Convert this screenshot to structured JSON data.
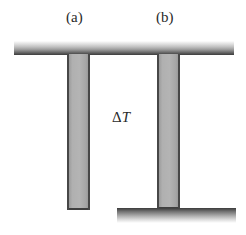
{
  "figure": {
    "type": "thermal-expansion-column-diagram",
    "background_color": "#ffffff",
    "width_px": 246,
    "height_px": 235
  },
  "labels": {
    "panel_a": "(a)",
    "panel_b": "(b)"
  },
  "annotation": {
    "delta_symbol": "Δ",
    "temperature_symbol": "T",
    "full_text": "ΔT"
  },
  "elements": {
    "top_bar": {
      "name": "top-support-bar",
      "gradient_from": "#ffffff",
      "gradient_to": "#3d3d3d"
    },
    "bottom_bar": {
      "name": "bottom-support-bar",
      "gradient_from": "#3c3c3c",
      "gradient_to": "#ffffff"
    },
    "column_a": {
      "name": "column-a",
      "fill": "#b2b2b2",
      "edge": "#474747"
    },
    "column_b": {
      "name": "column-b",
      "fill": "#b2b2b2",
      "edge": "#474747"
    }
  }
}
